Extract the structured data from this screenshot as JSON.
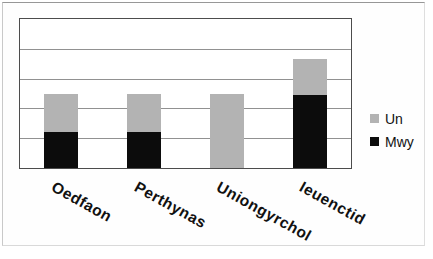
{
  "chart_data": {
    "type": "bar",
    "stacked": true,
    "title": "",
    "xlabel": "",
    "ylabel": "",
    "categories": [
      "Oedfaon",
      "Perthynas",
      "Uniongyrchol",
      "Ieuenctid"
    ],
    "series": [
      {
        "name": "Mwy",
        "color": "#0c0c0c",
        "values": [
          1.2,
          1.2,
          0,
          2.45
        ]
      },
      {
        "name": "Un",
        "color": "#b3b3b3",
        "values": [
          1.3,
          1.3,
          2.5,
          1.2
        ]
      }
    ],
    "ylim": [
      0,
      5
    ],
    "gridline_interval": 1,
    "grid": true,
    "y_tick_labels_visible": false,
    "legend_position": "right",
    "legend_order": [
      "Un",
      "Mwy"
    ],
    "gridline_color": "#919191",
    "plot_border_color": "#4c4c4c"
  }
}
